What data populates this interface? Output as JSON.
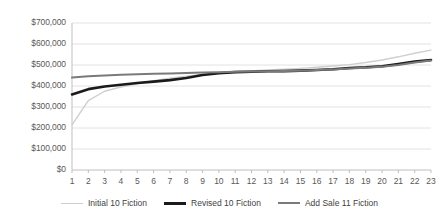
{
  "chart_data": {
    "type": "line",
    "title": "",
    "xlabel": "",
    "ylabel": "",
    "grid": true,
    "legend_position": "bottom",
    "x": [
      1,
      2,
      3,
      4,
      5,
      6,
      7,
      8,
      9,
      10,
      11,
      12,
      13,
      14,
      15,
      16,
      17,
      18,
      19,
      20,
      21,
      22,
      23
    ],
    "xlim": [
      1,
      23
    ],
    "ylim": [
      0,
      700000
    ],
    "ytick_values": [
      0,
      100000,
      200000,
      300000,
      400000,
      500000,
      600000,
      700000
    ],
    "ytick_labels": [
      "$0",
      "$100,000",
      "$200,000",
      "$300,000",
      "$400,000",
      "$500,000",
      "$600,000",
      "$700,000"
    ],
    "xtick_labels": [
      "1",
      "2",
      "3",
      "4",
      "5",
      "6",
      "7",
      "8",
      "9",
      "10",
      "11",
      "12",
      "13",
      "14",
      "15",
      "16",
      "17",
      "18",
      "19",
      "20",
      "21",
      "22",
      "23"
    ],
    "series": [
      {
        "name": "Initial 10 Fiction",
        "color": "#cfcfcf",
        "width": 1.4,
        "values": [
          215000,
          330000,
          375000,
          395000,
          410000,
          425000,
          437000,
          447000,
          455000,
          462000,
          468000,
          472000,
          476000,
          480000,
          484000,
          489000,
          495000,
          502000,
          512000,
          524000,
          539000,
          556000,
          571000
        ]
      },
      {
        "name": "Revised 10 Fiction",
        "color": "#1a1a1a",
        "width": 2.6,
        "values": [
          360000,
          385000,
          398000,
          406000,
          414000,
          421000,
          428000,
          438000,
          452000,
          461000,
          466000,
          468000,
          470000,
          471000,
          473000,
          476000,
          480000,
          486000,
          489000,
          494000,
          505000,
          516000,
          524000
        ]
      },
      {
        "name": "Add Sale 11 Fiction",
        "color": "#7a7a7a",
        "width": 2.0,
        "values": [
          440000,
          446000,
          450000,
          453000,
          456000,
          458000,
          460000,
          462000,
          464000,
          466000,
          468000,
          469000,
          470000,
          471000,
          473000,
          476000,
          479000,
          483000,
          487000,
          492000,
          500000,
          512000,
          521000
        ]
      }
    ],
    "axis_color": "#bfbfbf",
    "grid_color": "#e2e2e2",
    "tick_color": "#595959"
  },
  "legend": {
    "entries": [
      {
        "label": "Initial 10 Fiction"
      },
      {
        "label": "Revised 10 Fiction"
      },
      {
        "label": "Add Sale 11 Fiction"
      }
    ]
  }
}
